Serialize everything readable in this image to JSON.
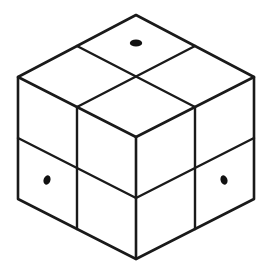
{
  "figure": {
    "shape_name": "cube",
    "subdivision": "2x2x2",
    "projection": "isometric",
    "background_color": "#ffffff",
    "line_color": "#1a1a1a",
    "face_color": "#ffffff",
    "pip_color": "#111111",
    "line_width": "2.6",
    "pip_count": "3"
  },
  "geometry": {
    "top_apex": {
      "x": 136,
      "y": 15
    },
    "left_corner_top": {
      "x": 18,
      "y": 77
    },
    "right_corner_top": {
      "x": 254,
      "y": 77
    },
    "front_center_top": {
      "x": 136,
      "y": 137
    },
    "left_corner_bottom": {
      "x": 18,
      "y": 199
    },
    "right_corner_bottom": {
      "x": 254,
      "y": 199
    },
    "front_center_bottom": {
      "x": 136,
      "y": 259
    },
    "side_face_height": 122,
    "mid_row_offset": 61,
    "top_left_mid": {
      "x": 77,
      "y": 46
    },
    "top_right_mid": {
      "x": 195,
      "y": 46
    },
    "top_left_lower_mid": {
      "x": 77,
      "y": 107
    },
    "top_right_lower_mid": {
      "x": 195,
      "y": 107
    }
  },
  "faces": {
    "top": {
      "label": "top-face",
      "cells": [
        {
          "id": "top-back",
          "center_x": 136,
          "center_y": 76,
          "has_pip": true
        },
        {
          "id": "top-left",
          "center_x": 77,
          "center_y": 107,
          "has_pip": false
        },
        {
          "id": "top-right",
          "center_x": 195,
          "center_y": 107,
          "has_pip": false
        },
        {
          "id": "top-front",
          "center_x": 136,
          "center_y": 137,
          "has_pip": false
        }
      ]
    },
    "left": {
      "label": "left-face",
      "cells": [
        {
          "id": "left-upper-left",
          "has_pip": false
        },
        {
          "id": "left-upper-right",
          "has_pip": false
        },
        {
          "id": "left-lower-left",
          "has_pip": true
        },
        {
          "id": "left-lower-right",
          "has_pip": false
        }
      ]
    },
    "right": {
      "label": "right-face",
      "cells": [
        {
          "id": "right-upper-left",
          "has_pip": false
        },
        {
          "id": "right-upper-right",
          "has_pip": false
        },
        {
          "id": "right-lower-left",
          "has_pip": false
        },
        {
          "id": "right-lower-right",
          "has_pip": true
        }
      ]
    }
  },
  "pips": [
    {
      "id": "pip-top-back",
      "face": "top-face",
      "cell": "top-back",
      "cx": 136,
      "cy": 43,
      "rx": 6.2,
      "ry": 3.6,
      "rotation": 0
    },
    {
      "id": "pip-left-lower-left",
      "face": "left-face",
      "cell": "left-lower-left",
      "cx": 47,
      "cy": 180,
      "rx": 3.4,
      "ry": 4.8,
      "rotation": 20
    },
    {
      "id": "pip-right-lower-right",
      "face": "right-face",
      "cell": "right-lower-right",
      "cx": 224,
      "cy": 180,
      "rx": 3.4,
      "ry": 4.8,
      "rotation": -20
    }
  ],
  "edges": {
    "outline_path": "M 136 15 L 254 77 L 254 199 L 136 259 L 18 199 L 18 77 Z",
    "top_left_diag": "M 18 77 L 136 137",
    "top_right_diag": "M 254 77 L 136 137",
    "top_seam_left": "M 77 46 L 195 107",
    "top_seam_right": "M 195 46 L 77 107",
    "front_vertical": "M 136 137 L 136 259",
    "left_vertical_mid": "M 77 107 L 77 229",
    "right_vertical_mid": "M 195 107 L 195 229",
    "left_horizontal_mid": "M 18 138 L 136 198",
    "right_horizontal_mid": "M 254 138 L 136 198"
  }
}
